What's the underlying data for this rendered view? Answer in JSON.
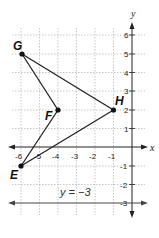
{
  "graph": {
    "x_axis_label": "x",
    "y_axis_label": "y",
    "x_ticks": [
      {
        "value": -6,
        "label": "-6"
      },
      {
        "value": -5,
        "label": "-5"
      },
      {
        "value": -4,
        "label": "-4"
      },
      {
        "value": -3,
        "label": "-3"
      },
      {
        "value": -2,
        "label": "-2"
      },
      {
        "value": -1,
        "label": "-1"
      }
    ],
    "y_ticks": [
      {
        "value": 6,
        "label": "6"
      },
      {
        "value": 5,
        "label": "5"
      },
      {
        "value": 4,
        "label": "4"
      },
      {
        "value": 3,
        "label": "3"
      },
      {
        "value": 2,
        "label": "2"
      },
      {
        "value": 1,
        "label": "1"
      },
      {
        "value": -1,
        "label": "-1"
      },
      {
        "value": -2,
        "label": "-2"
      },
      {
        "value": -3,
        "label": "-3"
      }
    ],
    "points": {
      "G": {
        "label": "G",
        "x": -6,
        "y": 5
      },
      "F": {
        "label": "F",
        "x": -4,
        "y": 2
      },
      "H": {
        "label": "H",
        "x": -1,
        "y": 2
      },
      "E": {
        "label": "E",
        "x": -6,
        "y": -1
      }
    },
    "line_label": "y = −3",
    "line_y": -3,
    "colors": {
      "ink": "#222222",
      "grid": "#aaaaaa"
    }
  }
}
